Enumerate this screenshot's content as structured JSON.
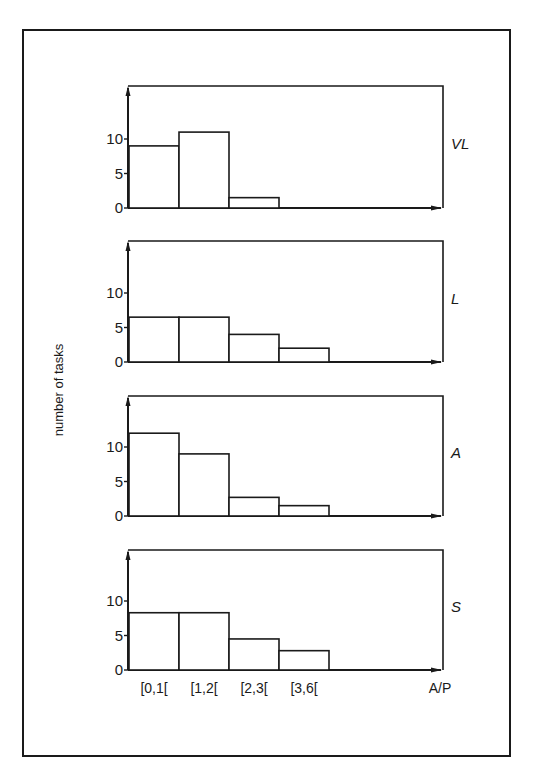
{
  "figure": {
    "ylabel": "number of tasks",
    "xlabel": "A/P"
  },
  "chart_data": {
    "type": "bar",
    "title": "",
    "xlabel": "A/P",
    "ylabel": "number of tasks",
    "categories": [
      "[0,1[",
      "[1,2[",
      "[2,3[",
      "[3,6["
    ],
    "yticks": [
      0,
      5,
      10
    ],
    "ylim": [
      0,
      15
    ],
    "grid": false,
    "legend": "none",
    "panels": [
      {
        "name": "VL",
        "values": [
          9,
          11,
          1.5,
          0
        ]
      },
      {
        "name": "L",
        "values": [
          6.5,
          6.5,
          4,
          2
        ]
      },
      {
        "name": "A",
        "values": [
          12,
          9,
          2.7,
          1.5
        ]
      },
      {
        "name": "S",
        "values": [
          8.3,
          8.3,
          4.5,
          2.8
        ]
      }
    ]
  }
}
